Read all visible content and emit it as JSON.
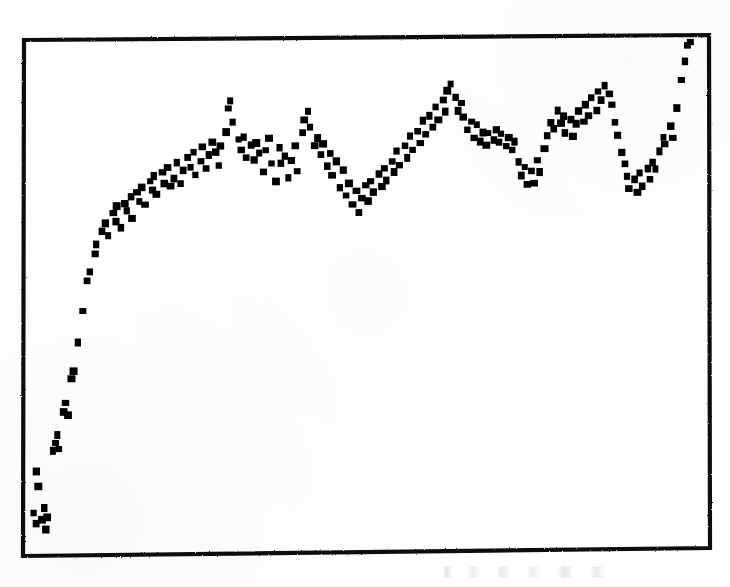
{
  "figure": {
    "kind": "scanned-scatter-plot",
    "background_color": "#ffffff",
    "ink_color": "#000000",
    "frame": {
      "visible": true,
      "style": "solid rectangular box, all four sides, rough photocopy edges, slightly rotated",
      "line_color": "#111111",
      "line_width_px": 4,
      "left_px": 24,
      "top_px": 36,
      "right_px": 709,
      "bottom_px": 553,
      "skew_note": "top edge rises ~4px left-to-right; bottom edge rises ~6px left-to-right"
    },
    "caption": {
      "visible": true,
      "legible": false,
      "text": "",
      "note": "faint illegible smudge of text below the bottom axis near the right"
    }
  },
  "chart_data": {
    "type": "scatter",
    "title": "",
    "subtitle": "",
    "xlabel": "",
    "ylabel": "",
    "legend": [],
    "legend_position": "none",
    "grid": false,
    "axis_ticks": false,
    "tick_labels": [],
    "annotations": [],
    "marker": {
      "shape": "square",
      "color": "#000000",
      "size_px": 7
    },
    "xlim": [
      0,
      100
    ],
    "ylim": [
      0,
      100
    ],
    "series": [
      {
        "name": "series-1",
        "n_points": 201,
        "points": [
          [
            0.6,
            6.2
          ],
          [
            0.9,
            4.1
          ],
          [
            1.3,
            11.6
          ],
          [
            1.7,
            5.0
          ],
          [
            2.0,
            7.4
          ],
          [
            2.3,
            3.0
          ],
          [
            2.6,
            5.6
          ],
          [
            1.0,
            14.6
          ],
          [
            3.4,
            18.8
          ],
          [
            3.8,
            20.3
          ],
          [
            4.0,
            22.0
          ],
          [
            4.3,
            19.2
          ],
          [
            5.0,
            26.4
          ],
          [
            5.3,
            28.1
          ],
          [
            5.6,
            25.7
          ],
          [
            6.2,
            33.0
          ],
          [
            6.5,
            34.6
          ],
          [
            7.1,
            40.2
          ],
          [
            7.8,
            46.4
          ],
          [
            8.5,
            52.6
          ],
          [
            8.8,
            54.4
          ],
          [
            9.6,
            58.0
          ],
          [
            9.9,
            59.8
          ],
          [
            10.8,
            62.4
          ],
          [
            11.2,
            63.9
          ],
          [
            11.6,
            61.4
          ],
          [
            12.3,
            66.0
          ],
          [
            12.7,
            64.4
          ],
          [
            13.0,
            67.2
          ],
          [
            13.4,
            63.2
          ],
          [
            14.1,
            68.0
          ],
          [
            14.5,
            66.4
          ],
          [
            14.9,
            69.2
          ],
          [
            15.2,
            65.0
          ],
          [
            15.9,
            70.1
          ],
          [
            16.3,
            68.4
          ],
          [
            16.7,
            71.2
          ],
          [
            17.0,
            67.6
          ],
          [
            17.8,
            72.3
          ],
          [
            18.1,
            70.6
          ],
          [
            18.5,
            73.4
          ],
          [
            18.9,
            69.8
          ],
          [
            19.6,
            74.2
          ],
          [
            20.0,
            72.0
          ],
          [
            20.4,
            75.1
          ],
          [
            20.8,
            71.4
          ],
          [
            21.5,
            73.0
          ],
          [
            21.9,
            76.0
          ],
          [
            22.3,
            71.8
          ],
          [
            22.7,
            74.6
          ],
          [
            23.4,
            77.2
          ],
          [
            23.8,
            75.0
          ],
          [
            24.2,
            78.1
          ],
          [
            24.6,
            73.6
          ],
          [
            25.3,
            76.4
          ],
          [
            25.7,
            79.0
          ],
          [
            26.1,
            74.8
          ],
          [
            26.5,
            77.6
          ],
          [
            27.2,
            80.2
          ],
          [
            27.6,
            78.0
          ],
          [
            28.0,
            75.4
          ],
          [
            28.4,
            79.4
          ],
          [
            29.1,
            82.0
          ],
          [
            29.5,
            86.8
          ],
          [
            29.8,
            88.4
          ],
          [
            30.2,
            84.0
          ],
          [
            30.9,
            80.6
          ],
          [
            31.3,
            78.4
          ],
          [
            31.7,
            81.2
          ],
          [
            32.1,
            77.0
          ],
          [
            32.8,
            79.6
          ],
          [
            33.2,
            76.4
          ],
          [
            33.6,
            80.0
          ],
          [
            34.0,
            77.8
          ],
          [
            34.7,
            74.2
          ],
          [
            35.1,
            78.6
          ],
          [
            35.5,
            81.0
          ],
          [
            35.9,
            76.0
          ],
          [
            36.6,
            72.4
          ],
          [
            37.0,
            79.0
          ],
          [
            37.4,
            75.8
          ],
          [
            37.8,
            77.4
          ],
          [
            38.5,
            73.0
          ],
          [
            38.9,
            76.6
          ],
          [
            39.3,
            79.2
          ],
          [
            39.7,
            74.4
          ],
          [
            40.4,
            82.0
          ],
          [
            40.8,
            84.6
          ],
          [
            41.2,
            86.2
          ],
          [
            41.6,
            83.0
          ],
          [
            42.3,
            79.4
          ],
          [
            42.7,
            81.0
          ],
          [
            43.1,
            77.6
          ],
          [
            43.5,
            79.8
          ],
          [
            44.2,
            75.2
          ],
          [
            44.6,
            78.0
          ],
          [
            45.0,
            73.4
          ],
          [
            45.4,
            76.2
          ],
          [
            46.1,
            71.0
          ],
          [
            46.5,
            74.6
          ],
          [
            46.9,
            69.4
          ],
          [
            47.3,
            72.0
          ],
          [
            48.0,
            67.8
          ],
          [
            48.4,
            70.4
          ],
          [
            48.8,
            66.2
          ],
          [
            49.2,
            69.0
          ],
          [
            49.9,
            71.6
          ],
          [
            50.3,
            68.4
          ],
          [
            50.7,
            72.2
          ],
          [
            51.1,
            70.0
          ],
          [
            51.8,
            73.8
          ],
          [
            52.2,
            71.4
          ],
          [
            52.6,
            75.0
          ],
          [
            53.0,
            72.6
          ],
          [
            53.7,
            76.4
          ],
          [
            54.1,
            74.0
          ],
          [
            54.5,
            78.2
          ],
          [
            54.9,
            75.6
          ],
          [
            55.6,
            79.4
          ],
          [
            56.0,
            77.0
          ],
          [
            56.4,
            81.2
          ],
          [
            56.8,
            78.6
          ],
          [
            57.5,
            82.4
          ],
          [
            57.9,
            80.0
          ],
          [
            58.3,
            84.2
          ],
          [
            58.7,
            81.6
          ],
          [
            59.4,
            85.4
          ],
          [
            59.8,
            83.0
          ],
          [
            60.2,
            87.2
          ],
          [
            60.6,
            84.6
          ],
          [
            61.3,
            88.4
          ],
          [
            61.7,
            86.0
          ],
          [
            62.1,
            90.2
          ],
          [
            62.5,
            91.8
          ],
          [
            63.2,
            89.0
          ],
          [
            63.6,
            86.4
          ],
          [
            64.0,
            88.0
          ],
          [
            64.4,
            85.2
          ],
          [
            65.1,
            82.6
          ],
          [
            65.5,
            84.2
          ],
          [
            65.9,
            81.0
          ],
          [
            66.3,
            83.4
          ],
          [
            67.0,
            80.2
          ],
          [
            67.4,
            82.0
          ],
          [
            67.8,
            79.4
          ],
          [
            68.2,
            81.8
          ],
          [
            68.9,
            80.6
          ],
          [
            69.3,
            82.4
          ],
          [
            69.7,
            80.0
          ],
          [
            70.1,
            81.6
          ],
          [
            70.8,
            79.2
          ],
          [
            71.2,
            81.0
          ],
          [
            71.6,
            78.4
          ],
          [
            72.0,
            80.2
          ],
          [
            72.7,
            76.0
          ],
          [
            73.1,
            73.4
          ],
          [
            73.5,
            75.0
          ],
          [
            73.9,
            71.8
          ],
          [
            74.6,
            74.4
          ],
          [
            75.0,
            72.0
          ],
          [
            75.4,
            76.6
          ],
          [
            75.8,
            74.2
          ],
          [
            76.5,
            78.8
          ],
          [
            76.9,
            81.4
          ],
          [
            77.3,
            84.0
          ],
          [
            77.7,
            82.6
          ],
          [
            78.4,
            86.2
          ],
          [
            78.8,
            83.8
          ],
          [
            79.2,
            85.4
          ],
          [
            79.6,
            82.0
          ],
          [
            80.3,
            84.6
          ],
          [
            80.7,
            81.2
          ],
          [
            81.1,
            83.8
          ],
          [
            81.5,
            86.4
          ],
          [
            82.2,
            84.0
          ],
          [
            82.6,
            87.6
          ],
          [
            83.0,
            85.2
          ],
          [
            83.4,
            88.8
          ],
          [
            84.1,
            86.4
          ],
          [
            84.5,
            90.0
          ],
          [
            84.9,
            88.6
          ],
          [
            85.3,
            91.2
          ],
          [
            86.0,
            89.8
          ],
          [
            86.4,
            87.4
          ],
          [
            86.8,
            84.0
          ],
          [
            87.2,
            81.6
          ],
          [
            87.9,
            78.2
          ],
          [
            88.3,
            75.8
          ],
          [
            88.7,
            73.4
          ],
          [
            89.1,
            71.0
          ],
          [
            89.8,
            72.6
          ],
          [
            90.2,
            70.2
          ],
          [
            90.6,
            73.8
          ],
          [
            91.0,
            71.4
          ],
          [
            91.7,
            75.0
          ],
          [
            92.1,
            72.6
          ],
          [
            92.5,
            76.2
          ],
          [
            92.9,
            74.8
          ],
          [
            93.6,
            78.4
          ],
          [
            94.0,
            81.0
          ],
          [
            94.4,
            79.6
          ],
          [
            95.1,
            83.2
          ],
          [
            95.5,
            80.8
          ],
          [
            96.2,
            87.0
          ],
          [
            96.9,
            92.4
          ],
          [
            97.4,
            96.0
          ],
          [
            97.8,
            99.2
          ],
          [
            98.0,
            100.0
          ]
        ]
      }
    ]
  }
}
